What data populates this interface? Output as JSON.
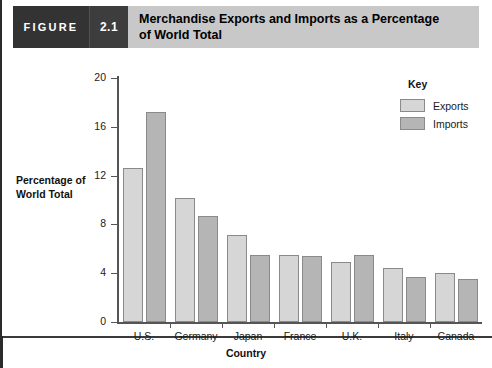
{
  "header": {
    "figure_word": "FIGURE",
    "figure_number": "2.1",
    "title_line1": "Merchandise Exports and Imports as a Percentage",
    "title_line2": "of World Total"
  },
  "legend": {
    "title": "Key",
    "entries": [
      {
        "label": "Exports",
        "color": "#d6d6d6"
      },
      {
        "label": "Imports",
        "color": "#b5b5b5"
      }
    ]
  },
  "axes": {
    "y_title_line1": "Percentage of",
    "y_title_line2": "World Total",
    "x_title": "Country",
    "y_ticks": [
      "0",
      "4",
      "8",
      "12",
      "16",
      "20"
    ]
  },
  "chart_data": {
    "type": "bar",
    "title": "Merchandise Exports and Imports as a Percentage of World Total",
    "xlabel": "Country",
    "ylabel": "Percentage of World Total",
    "ylim": [
      0,
      20
    ],
    "ytick_values": [
      0,
      4,
      8,
      12,
      16,
      20
    ],
    "grid": false,
    "legend_position": "top-right",
    "categories": [
      "U.S.",
      "Germany",
      "Japan",
      "France",
      "U.K.",
      "Italy",
      "Canada"
    ],
    "series": [
      {
        "name": "Exports",
        "color": "#d6d6d6",
        "values": [
          12.6,
          10.2,
          7.1,
          5.5,
          4.9,
          4.4,
          4.0
        ]
      },
      {
        "name": "Imports",
        "color": "#b5b5b5",
        "values": [
          17.2,
          8.7,
          5.5,
          5.4,
          5.5,
          3.7,
          3.5
        ]
      }
    ]
  }
}
